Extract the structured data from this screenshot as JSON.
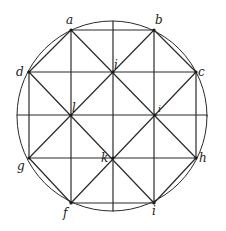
{
  "diagram": {
    "type": "geometric-construction",
    "stroke_color": "#2a2a2a",
    "background": "#ffffff",
    "circle": {
      "cx": 112,
      "cy": 116,
      "r": 95
    },
    "points": {
      "a": {
        "x": 71,
        "y": 30,
        "label": "a"
      },
      "b": {
        "x": 154,
        "y": 30,
        "label": "b"
      },
      "c": {
        "x": 196,
        "y": 72,
        "label": "c"
      },
      "h": {
        "x": 196,
        "y": 158,
        "label": "h"
      },
      "i_bottom": {
        "x": 154,
        "y": 203,
        "label": "i"
      },
      "f": {
        "x": 71,
        "y": 203,
        "label": "f"
      },
      "g": {
        "x": 29,
        "y": 158,
        "label": "g"
      },
      "d": {
        "x": 29,
        "y": 72,
        "label": "d"
      },
      "i_top": {
        "x": 113,
        "y": 72,
        "label": "i"
      },
      "l": {
        "x": 71,
        "y": 115,
        "label": "l"
      },
      "k": {
        "x": 113,
        "y": 158,
        "label": "k"
      },
      "right_mid": {
        "x": 155,
        "y": 115,
        "label": "i"
      }
    },
    "labels": [
      {
        "text": "a",
        "x": 66,
        "y": 24
      },
      {
        "text": "b",
        "x": 155,
        "y": 24
      },
      {
        "text": "c",
        "x": 198,
        "y": 74
      },
      {
        "text": "d",
        "x": 16,
        "y": 75
      },
      {
        "text": "i",
        "x": 114,
        "y": 69
      },
      {
        "text": "l",
        "x": 72,
        "y": 112
      },
      {
        "text": "i",
        "x": 158,
        "y": 112
      },
      {
        "text": "k",
        "x": 102,
        "y": 162
      },
      {
        "text": "h",
        "x": 199,
        "y": 160
      },
      {
        "text": "g",
        "x": 17,
        "y": 168
      },
      {
        "text": "f",
        "x": 63,
        "y": 216
      },
      {
        "text": "i",
        "x": 153,
        "y": 214
      }
    ]
  }
}
